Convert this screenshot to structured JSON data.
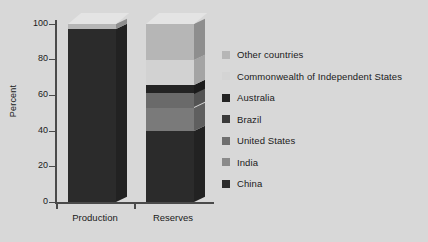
{
  "chart_data": {
    "type": "bar",
    "subtype": "stacked-column-3d",
    "title": "",
    "xlabel": "",
    "ylabel": "Percent",
    "ylim": [
      0,
      100
    ],
    "yticks": [
      0,
      20,
      40,
      60,
      80,
      100
    ],
    "grid": false,
    "legend_position": "right",
    "categories": [
      "Production",
      "Reserves"
    ],
    "series": [
      {
        "name": "China",
        "color": "#2b2b2b",
        "values": [
          97,
          40
        ]
      },
      {
        "name": "India",
        "color": "#7a7a7a",
        "values": [
          0,
          13
        ]
      },
      {
        "name": "United States",
        "color": "#6f6f6f",
        "values": [
          0,
          0
        ]
      },
      {
        "name": "Brazil",
        "color": "#6a6a6a",
        "values": [
          0,
          8
        ]
      },
      {
        "name": "Australia",
        "color": "#232323",
        "values": [
          0,
          5
        ]
      },
      {
        "name": "Commonwealth of Independent States",
        "color": "#d2d2d2",
        "values": [
          0,
          14
        ]
      },
      {
        "name": "Other countries",
        "color": "#b6b6b6",
        "values": [
          3,
          20
        ]
      }
    ]
  },
  "axes": {
    "y_title": "Percent",
    "y_ticks": [
      "100",
      "80",
      "60",
      "40",
      "20",
      "0"
    ],
    "x_categories": [
      "Production",
      "Reserves"
    ]
  },
  "legend": {
    "items": [
      {
        "label": "Other countries",
        "color": "#b6b6b6"
      },
      {
        "label": "Commonwealth of Independent States",
        "color": "#d4d4d4"
      },
      {
        "label": "Australia",
        "color": "#232323"
      },
      {
        "label": "Brazil",
        "color": "#3a3a3a"
      },
      {
        "label": "United States",
        "color": "#6f6f6f"
      },
      {
        "label": "India",
        "color": "#8a8a8a"
      },
      {
        "label": "China",
        "color": "#2b2b2b"
      }
    ]
  },
  "colors": {
    "background": "#d8d8d8",
    "axis": "#4a4a4a",
    "text": "#1a1a1a"
  }
}
